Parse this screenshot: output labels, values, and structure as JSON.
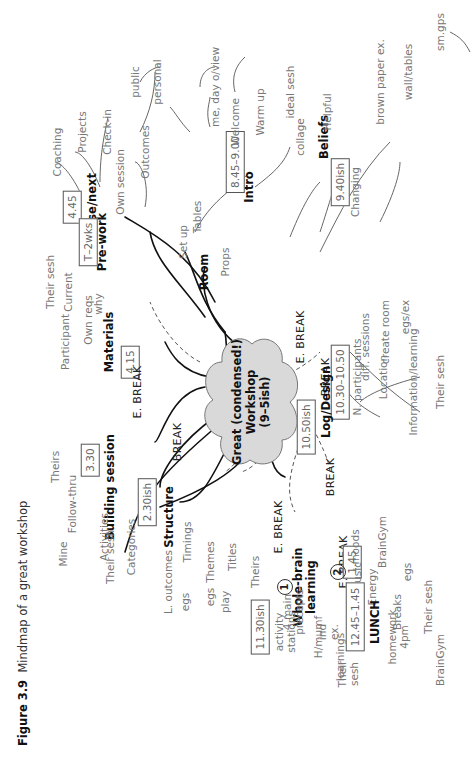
{
  "caption": {
    "label": "Figure 3.9",
    "title": "Mindmap of a great workshop"
  },
  "center": {
    "text": "Great (condensed!)\nWorkshop\n(9–5ish)",
    "fill": "#d9d9d9"
  },
  "branches": {
    "close_next": {
      "label": "Close/next",
      "time": "4.45",
      "children": [
        "Coaching",
        "Projects",
        "Check-in"
      ]
    },
    "pre_work": {
      "label": "Pre-work",
      "time": "T–2wks",
      "children": [
        "Own session",
        "Outcomes",
        "public",
        "personal"
      ]
    },
    "room": {
      "label": "Room",
      "children": [
        "Set up",
        "Tables",
        "Props"
      ]
    },
    "intro": {
      "label": "Intro",
      "time": "8.45–9.00",
      "children": [
        "Welcome",
        "me, day o/view",
        "Warm up",
        "ideal sesh"
      ]
    },
    "beliefs": {
      "label": "Beliefs",
      "time": "9.40ish",
      "children": [
        "Helpful",
        "collage",
        "Changing",
        "brown paper ex.",
        "wall/tables",
        "sm.gps"
      ]
    },
    "materials": {
      "label": "Materials",
      "time": "4.15",
      "children": [
        "Own reqs",
        "why",
        "Participant",
        "Their sesh",
        "Current"
      ]
    },
    "building_session": {
      "label": "Building session",
      "time": "3.30",
      "children": [
        "Follow-thru",
        "Mine",
        "Theirs",
        "Activities",
        "Their sesh",
        "Categories"
      ]
    },
    "structure": {
      "label": "Structure",
      "time": "2.30ish",
      "children": [
        "Timings",
        "L. outcomes",
        "egs",
        "Themes",
        "egs",
        "play",
        "Titles",
        "Theirs"
      ]
    },
    "whole_brain": {
      "label": "Whole-brain\nlearning",
      "marker1": "1",
      "marker2": "2",
      "time": "1.45",
      "children": [
        "activity\nstations",
        "4 main\nprecepts",
        "H/mumf",
        "ind\nex.",
        "learnings",
        "Their\nsesh",
        "Music",
        "moods",
        "Energy",
        "BrainGym",
        "Breaks",
        "egs",
        "Their sesh",
        "homework\n4pm",
        "BrainGym"
      ]
    },
    "lunch": {
      "label": "LUNCH",
      "time": "12.45–1.45"
    },
    "lunch_slot": {
      "time": "11.30ish"
    },
    "log_design": {
      "label": "Log/Design",
      "time": "10.50ish",
      "children": [
        "N. participants",
        "diff. sessions",
        "Location",
        "create room",
        "Information/learning",
        "egs/ex",
        "Their sesh"
      ]
    },
    "break_morning": {
      "label": "BREAK",
      "time": "10.30–10.50"
    }
  },
  "breaks": [
    "E. BREAK",
    "E. BREAK",
    "BREAK",
    "E. BREAK",
    "BREAK",
    "E. BREAK"
  ]
}
